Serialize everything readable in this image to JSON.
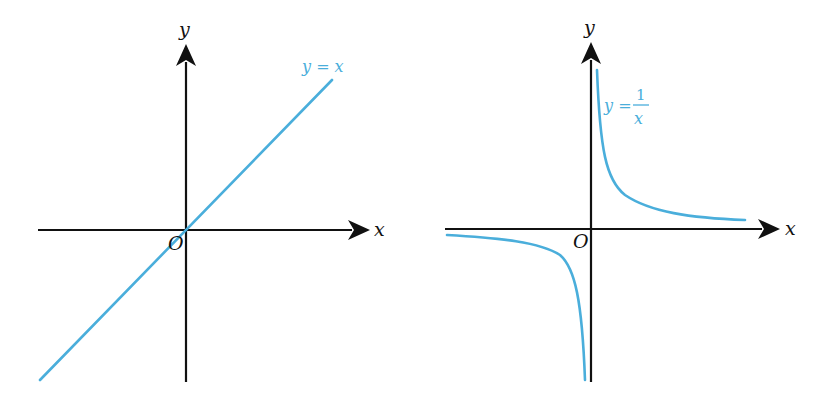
{
  "graphs": [
    {
      "id": "linear",
      "x_axis_label": "x",
      "y_axis_label": "y",
      "origin_label": "O",
      "curve_label": "y = x",
      "equation": "y = x"
    },
    {
      "id": "reciprocal",
      "x_axis_label": "x",
      "y_axis_label": "y",
      "origin_label": "O",
      "curve_label_lhs": "y =",
      "curve_label_num": "1",
      "curve_label_den": "x",
      "equation": "y = 1/x"
    }
  ],
  "colors": {
    "curve": "#4aaedb",
    "axis": "#111111"
  }
}
